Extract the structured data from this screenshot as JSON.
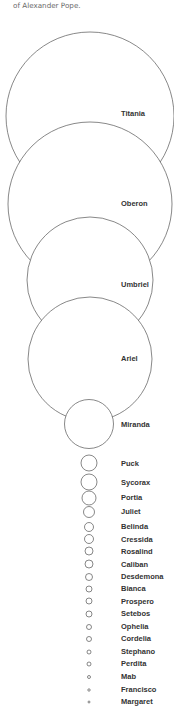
{
  "caption": "of Alexander Pope.",
  "chart_data": {
    "type": "bubble",
    "title": "",
    "label_x": 121,
    "series": [
      {
        "name": "Titania",
        "cx": 90,
        "cy": 116,
        "r": 84,
        "label_y": 116
      },
      {
        "name": "Oberon",
        "cx": 90,
        "cy": 204,
        "r": 82,
        "label_y": 206
      },
      {
        "name": "Umbriel",
        "cx": 90,
        "cy": 280,
        "r": 63,
        "label_y": 287
      },
      {
        "name": "Ariel",
        "cx": 90,
        "cy": 359,
        "r": 62,
        "label_y": 361
      },
      {
        "name": "Miranda",
        "cx": 89,
        "cy": 424,
        "r": 24.5,
        "label_y": 427
      },
      {
        "name": "Puck",
        "cx": 89,
        "cy": 463,
        "r": 8,
        "label_y": 466
      },
      {
        "name": "Sycorax",
        "cx": 89,
        "cy": 482,
        "r": 8,
        "label_y": 485
      },
      {
        "name": "Portia",
        "cx": 89,
        "cy": 498,
        "r": 7,
        "label_y": 500
      },
      {
        "name": "Juliet",
        "cx": 89,
        "cy": 512,
        "r": 5.5,
        "label_y": 514
      },
      {
        "name": "Belinda",
        "cx": 89,
        "cy": 527,
        "r": 4.5,
        "label_y": 529
      },
      {
        "name": "Cressida",
        "cx": 89,
        "cy": 539,
        "r": 4.5,
        "label_y": 542
      },
      {
        "name": "Rosalind",
        "cx": 89,
        "cy": 551,
        "r": 4,
        "label_y": 554
      },
      {
        "name": "Caliban",
        "cx": 89,
        "cy": 564,
        "r": 4,
        "label_y": 567
      },
      {
        "name": "Desdemona",
        "cx": 89,
        "cy": 577,
        "r": 3.5,
        "label_y": 579
      },
      {
        "name": "Bianca",
        "cx": 89,
        "cy": 589,
        "r": 3,
        "label_y": 591
      },
      {
        "name": "Prospero",
        "cx": 89,
        "cy": 601,
        "r": 3,
        "label_y": 604
      },
      {
        "name": "Setebos",
        "cx": 89,
        "cy": 614,
        "r": 3,
        "label_y": 616
      },
      {
        "name": "Ophelia",
        "cx": 89,
        "cy": 627,
        "r": 2.5,
        "label_y": 629
      },
      {
        "name": "Cordelia",
        "cx": 89,
        "cy": 639,
        "r": 2.5,
        "label_y": 641
      },
      {
        "name": "Stephano",
        "cx": 89,
        "cy": 652,
        "r": 2,
        "label_y": 654
      },
      {
        "name": "Perdita",
        "cx": 89,
        "cy": 664,
        "r": 2,
        "label_y": 666
      },
      {
        "name": "Mab",
        "cx": 89,
        "cy": 677,
        "r": 1.5,
        "label_y": 679
      },
      {
        "name": "Francisco",
        "cx": 89,
        "cy": 690,
        "r": 1.2,
        "label_y": 692
      },
      {
        "name": "Margaret",
        "cx": 89,
        "cy": 702,
        "r": 1,
        "label_y": 704
      }
    ],
    "colors": {
      "stroke": "#555555",
      "fill": "#ffffff",
      "label": "#333333",
      "caption": "#6a6a6a"
    }
  }
}
